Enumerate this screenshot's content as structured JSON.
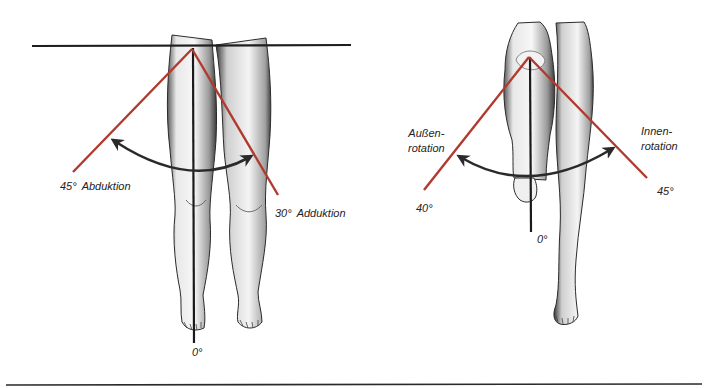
{
  "colors": {
    "reference_line": "#1e1e1e",
    "angle_line": "#b03a2e",
    "arrow": "#2a2a2a",
    "skin_shade": "#8a8a8a",
    "background": "#ffffff"
  },
  "left_figure": {
    "title": "Hip abduction / adduction (front view)",
    "labels": {
      "abduction_value": "45°",
      "abduction_text": "Abduktion",
      "adduction_value": "30°",
      "adduction_text": "Adduktion",
      "neutral": "0°"
    }
  },
  "right_figure": {
    "title": "Hip rotation (knee flexed)",
    "labels": {
      "external_line1": "Außen-",
      "external_line2": "rotation",
      "external_value": "40°",
      "internal_line1": "Innen-",
      "internal_line2": "rotation",
      "internal_value": "45°",
      "neutral": "0°"
    }
  }
}
